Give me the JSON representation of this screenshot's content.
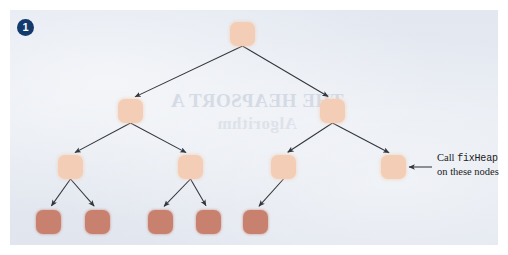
{
  "figure": {
    "step_badge": "1",
    "background_color": "#e3e7ef",
    "page_color": "#ffffff",
    "badge_color": "#123a6d",
    "node_light_color": "#f3cdb5",
    "node_dark_color": "#c9816f",
    "edge_color": "#33353c",
    "showthrough_text_1": "THE HEAPSORT A",
    "showthrough_text_2": "Algorithm"
  },
  "annotation": {
    "line1_prefix": "Call ",
    "line1_code": "fixHeap",
    "line2": "on these nodes",
    "arrow": "left-arrow-icon"
  },
  "tree": {
    "description": "binary heap tree, four levels",
    "nodes": [
      {
        "id": "n0",
        "level": 1,
        "x": 230,
        "y": 22,
        "shade": "light"
      },
      {
        "id": "n1",
        "level": 2,
        "x": 118,
        "y": 99,
        "shade": "light"
      },
      {
        "id": "n2",
        "level": 2,
        "x": 320,
        "y": 99,
        "shade": "light"
      },
      {
        "id": "n3",
        "level": 3,
        "x": 58,
        "y": 155,
        "shade": "light"
      },
      {
        "id": "n4",
        "level": 3,
        "x": 178,
        "y": 155,
        "shade": "light"
      },
      {
        "id": "n5",
        "level": 3,
        "x": 271,
        "y": 155,
        "shade": "light"
      },
      {
        "id": "n6",
        "level": 3,
        "x": 381,
        "y": 155,
        "shade": "light"
      },
      {
        "id": "n7",
        "level": 4,
        "x": 36,
        "y": 210,
        "shade": "dark"
      },
      {
        "id": "n8",
        "level": 4,
        "x": 85,
        "y": 210,
        "shade": "dark"
      },
      {
        "id": "n9",
        "level": 4,
        "x": 148,
        "y": 210,
        "shade": "dark"
      },
      {
        "id": "n10",
        "level": 4,
        "x": 196,
        "y": 210,
        "shade": "dark"
      },
      {
        "id": "n11",
        "level": 4,
        "x": 243,
        "y": 210,
        "shade": "dark"
      }
    ],
    "edges": [
      {
        "from": "n0",
        "to": "n1"
      },
      {
        "from": "n0",
        "to": "n2"
      },
      {
        "from": "n1",
        "to": "n3"
      },
      {
        "from": "n1",
        "to": "n4"
      },
      {
        "from": "n2",
        "to": "n5"
      },
      {
        "from": "n2",
        "to": "n6"
      },
      {
        "from": "n3",
        "to": "n7"
      },
      {
        "from": "n3",
        "to": "n8"
      },
      {
        "from": "n4",
        "to": "n9"
      },
      {
        "from": "n4",
        "to": "n10"
      },
      {
        "from": "n5",
        "to": "n11"
      }
    ],
    "annotation_target": "n6"
  }
}
